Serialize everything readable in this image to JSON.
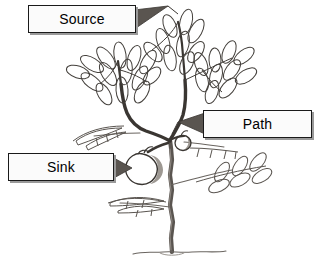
{
  "figure": {
    "type": "labeled-diagram",
    "background_color": "#ffffff",
    "ink_color": "#333333",
    "shade_color": "#8f8f8f",
    "pointer_color": "#555555"
  },
  "callouts": [
    {
      "id": "source",
      "label": "Source",
      "box": {
        "x": 28,
        "y": 5,
        "width": 108,
        "height": 28
      },
      "pointer_direction": "right",
      "points_to": "upper-leaves"
    },
    {
      "id": "path",
      "label": "Path",
      "box": {
        "x": 203,
        "y": 110,
        "width": 109,
        "height": 28
      },
      "pointer_direction": "left",
      "points_to": "branch-stem"
    },
    {
      "id": "sink",
      "label": "Sink",
      "box": {
        "x": 8,
        "y": 153,
        "width": 106,
        "height": 28
      },
      "pointer_direction": "right",
      "points_to": "fruit"
    }
  ],
  "plant": {
    "trunk_label": "trunk",
    "ground_label": "ground-line",
    "fruit_count": 2,
    "leaf_clusters": [
      "upper-left-compound-leaf",
      "upper-center-compound-leaf",
      "upper-right-compound-leaf",
      "mid-left-small-leaf",
      "mid-right-small-leaf",
      "lower-right-compound-leaf",
      "lower-left-small-leaf"
    ]
  }
}
